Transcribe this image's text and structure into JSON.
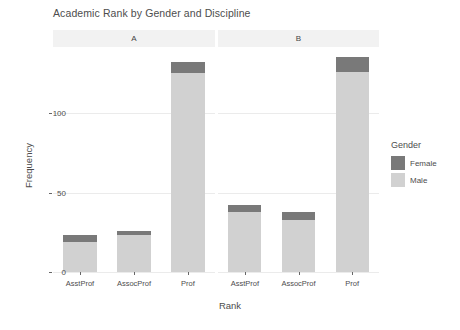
{
  "chart_data": {
    "type": "bar",
    "title": "Academic Rank by Gender and Discipline",
    "xlabel": "Rank",
    "ylabel": "Frequency",
    "categories": [
      "AsstProf",
      "AssocProf",
      "Prof"
    ],
    "facets": [
      {
        "label": "A",
        "series": [
          {
            "name": "Male",
            "values": [
              19,
              23,
              125
            ]
          },
          {
            "name": "Female",
            "values": [
              4,
              3,
              7
            ]
          }
        ],
        "totals": [
          23,
          26,
          132
        ]
      },
      {
        "label": "B",
        "series": [
          {
            "name": "Male",
            "values": [
              38,
              33,
              126
            ]
          },
          {
            "name": "Female",
            "values": [
              4,
              5,
              9
            ]
          }
        ],
        "totals": [
          42,
          38,
          135
        ]
      }
    ],
    "stacked": true,
    "stack_order": [
      "Male",
      "Female"
    ],
    "yticks": [
      0,
      50,
      100
    ],
    "ytick_labels": [
      "0",
      "50",
      "100"
    ],
    "ylim": [
      0,
      140
    ],
    "grid": true,
    "grid_axis": "y",
    "legend": {
      "title": "Gender",
      "position": "right",
      "entries": [
        {
          "label": "Female",
          "color": "#797979"
        },
        {
          "label": "Male",
          "color": "#d1d1d1"
        }
      ]
    },
    "facet_var": "Discipline",
    "colors": {
      "female": "#797979",
      "male": "#d1d1d1",
      "panel_background": "#ffffff",
      "strip_background": "#f2f2f2",
      "gridline": "#ebebeb",
      "text": "#4d4d4d"
    }
  }
}
